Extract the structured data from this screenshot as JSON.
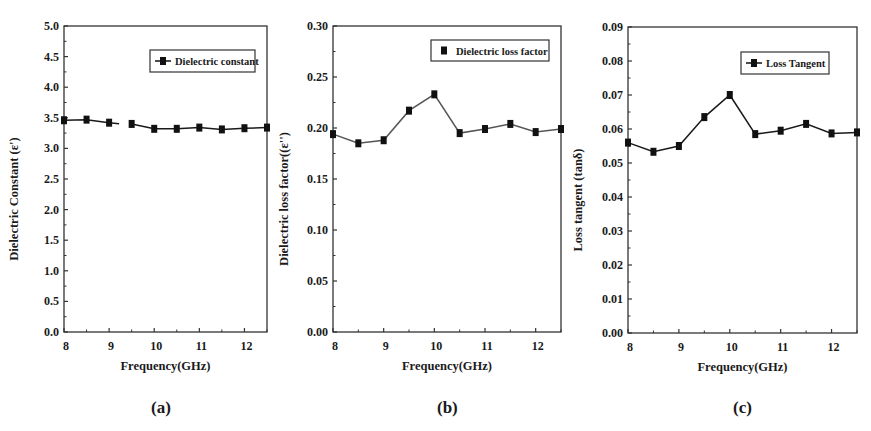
{
  "figure": {
    "captions": [
      "(a)",
      "(b)",
      "(c)"
    ]
  },
  "chart_data": [
    {
      "id": "a",
      "type": "line",
      "title": "",
      "xlabel": "Frequency(GHz)",
      "ylabel": "Dielectric Constant (ε')",
      "x": [
        8.0,
        8.5,
        9.0,
        9.5,
        10.0,
        10.5,
        11.0,
        11.5,
        12.0,
        12.5
      ],
      "series": [
        {
          "name": "Dielectric constant",
          "values": [
            3.46,
            3.47,
            3.42,
            3.4,
            3.32,
            3.32,
            3.34,
            3.31,
            3.33,
            3.34
          ],
          "marker": "square",
          "line": true,
          "gap_after_index": 2,
          "color": "#1a1a1a"
        }
      ],
      "xlim": [
        8,
        12.5
      ],
      "ylim": [
        0,
        5.0
      ],
      "xticks": [
        8,
        9,
        10,
        11,
        12
      ],
      "xtick_labels": [
        "8",
        "9",
        "10",
        "11",
        "12"
      ],
      "yticks": [
        0,
        0.5,
        1.0,
        1.5,
        2.0,
        2.5,
        3.0,
        3.5,
        4.0,
        4.5,
        5.0
      ],
      "ytick_labels": [
        "0.0",
        "0.5",
        "1.0",
        "1.5",
        "2.0",
        "2.5",
        "3.0",
        "3.5",
        "4.0",
        "4.5",
        "5.0"
      ],
      "grid": false,
      "legend_position": "upper right",
      "caption": "(a)"
    },
    {
      "id": "b",
      "type": "line",
      "title": "",
      "xlabel": "Frequency(GHz)",
      "ylabel": "Dielectric loss factor((ε'')",
      "x": [
        8.0,
        8.5,
        9.0,
        9.5,
        10.0,
        10.5,
        11.0,
        11.5,
        12.0,
        12.5
      ],
      "series": [
        {
          "name": "Dielectric loss factor",
          "values": [
            0.194,
            0.185,
            0.188,
            0.217,
            0.233,
            0.195,
            0.199,
            0.204,
            0.196,
            0.199
          ],
          "marker": "square",
          "line": true,
          "color": "#555555"
        }
      ],
      "xlim": [
        8,
        12.5
      ],
      "ylim": [
        0,
        0.3
      ],
      "xticks": [
        8,
        9,
        10,
        11,
        12
      ],
      "xtick_labels": [
        "8",
        "9",
        "10",
        "11",
        "12"
      ],
      "yticks": [
        0,
        0.05,
        0.1,
        0.15,
        0.2,
        0.25,
        0.3
      ],
      "ytick_labels": [
        "0.00",
        "0.05",
        "0.10",
        "0.15",
        "0.20",
        "0.25",
        "0.30"
      ],
      "grid": false,
      "legend_position": "upper right",
      "legend_line": false,
      "caption": "(b)"
    },
    {
      "id": "c",
      "type": "line",
      "title": "",
      "xlabel": "Frequency(GHz)",
      "ylabel": "Loss tangent (tanδ)",
      "x": [
        8.0,
        8.5,
        9.0,
        9.5,
        10.0,
        10.5,
        11.0,
        11.5,
        12.0,
        12.5
      ],
      "series": [
        {
          "name": "Loss Tangent",
          "values": [
            0.056,
            0.0533,
            0.055,
            0.0635,
            0.07,
            0.0585,
            0.0595,
            0.0615,
            0.0587,
            0.059
          ],
          "marker": "square",
          "line": true,
          "color": "#1a1a1a"
        }
      ],
      "xlim": [
        8,
        12.5
      ],
      "ylim": [
        0,
        0.09
      ],
      "xticks": [
        8,
        9,
        10,
        11,
        12
      ],
      "xtick_labels": [
        "8",
        "9",
        "10",
        "11",
        "12"
      ],
      "yticks": [
        0,
        0.01,
        0.02,
        0.03,
        0.04,
        0.05,
        0.06,
        0.07,
        0.08,
        0.09
      ],
      "ytick_labels": [
        "0.00",
        "0.01",
        "0.02",
        "0.03",
        "0.04",
        "0.05",
        "0.06",
        "0.07",
        "0.08",
        "0.09"
      ],
      "grid": false,
      "legend_position": "upper right",
      "legend_line": true,
      "caption": "(c)"
    }
  ]
}
